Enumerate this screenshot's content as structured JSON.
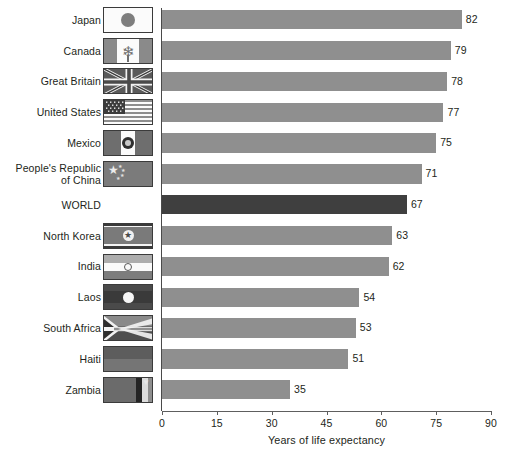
{
  "chart_data": {
    "type": "bar",
    "orientation": "horizontal",
    "title": "",
    "xlabel": "Years of life expectancy",
    "ylabel": "",
    "xlim": [
      0,
      90
    ],
    "xticks": [
      0,
      15,
      30,
      45,
      60,
      75,
      90
    ],
    "grid": false,
    "legend": null,
    "value_labels": true,
    "categories": [
      "Japan",
      "Canada",
      "Great Britain",
      "United States",
      "Mexico",
      "People's Republic of China",
      "WORLD",
      "North Korea",
      "India",
      "Laos",
      "South Africa",
      "Haiti",
      "Zambia"
    ],
    "values": [
      82,
      79,
      78,
      77,
      75,
      71,
      67,
      63,
      62,
      54,
      53,
      51,
      35
    ],
    "bar_color": "#8f8f8f",
    "highlight_color": "#3f3f3f",
    "highlight_category": "WORLD"
  },
  "axis": {
    "x_title": "Years of life expectancy",
    "ticks": [
      "0",
      "15",
      "30",
      "45",
      "60",
      "75",
      "90"
    ]
  },
  "rows": [
    {
      "label_lines": [
        "Japan"
      ],
      "value": "82",
      "flag": "japan-flag",
      "highlight": false
    },
    {
      "label_lines": [
        "Canada"
      ],
      "value": "79",
      "flag": "canada-flag",
      "highlight": false
    },
    {
      "label_lines": [
        "Great Britain"
      ],
      "value": "78",
      "flag": "great-britain-flag",
      "highlight": false
    },
    {
      "label_lines": [
        "United States"
      ],
      "value": "77",
      "flag": "united-states-flag",
      "highlight": false
    },
    {
      "label_lines": [
        "Mexico"
      ],
      "value": "75",
      "flag": "mexico-flag",
      "highlight": false
    },
    {
      "label_lines": [
        "People's Republic",
        "of China"
      ],
      "value": "71",
      "flag": "china-flag",
      "highlight": false
    },
    {
      "label_lines": [
        "WORLD"
      ],
      "value": "67",
      "flag": null,
      "highlight": true
    },
    {
      "label_lines": [
        "North Korea"
      ],
      "value": "63",
      "flag": "north-korea-flag",
      "highlight": false
    },
    {
      "label_lines": [
        "India"
      ],
      "value": "62",
      "flag": "india-flag",
      "highlight": false
    },
    {
      "label_lines": [
        "Laos"
      ],
      "value": "54",
      "flag": "laos-flag",
      "highlight": false
    },
    {
      "label_lines": [
        "South Africa"
      ],
      "value": "53",
      "flag": "south-africa-flag",
      "highlight": false
    },
    {
      "label_lines": [
        "Haiti"
      ],
      "value": "51",
      "flag": "haiti-flag",
      "highlight": false
    },
    {
      "label_lines": [
        "Zambia"
      ],
      "value": "35",
      "flag": "zambia-flag",
      "highlight": false
    }
  ]
}
